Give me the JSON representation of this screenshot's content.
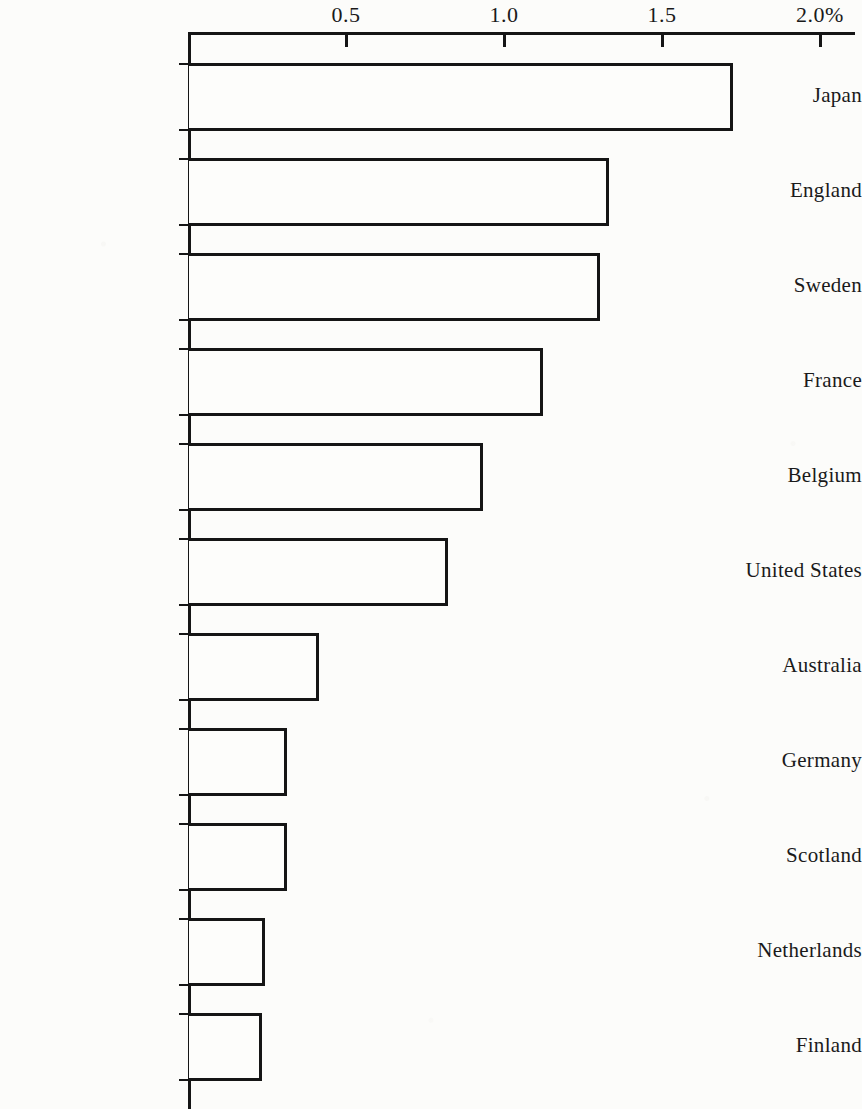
{
  "chart_data": {
    "type": "bar",
    "orientation": "horizontal",
    "title": "",
    "subtitle": "",
    "xlabel": "",
    "ylabel": "",
    "xlim": [
      0,
      2.0
    ],
    "grid": false,
    "legend": null,
    "unit": "%",
    "axis_ticks": [
      {
        "value": 0.5,
        "label": "0.5"
      },
      {
        "value": 1.0,
        "label": "1.0"
      },
      {
        "value": 1.5,
        "label": "1.5"
      },
      {
        "value": 2.0,
        "label": "2.0%"
      }
    ],
    "categories": [
      "Japan",
      "England",
      "Sweden",
      "France",
      "Belgium",
      "United States",
      "Australia",
      "Germany",
      "Scotland",
      "Netherlands",
      "Finland"
    ],
    "values": [
      1.72,
      1.33,
      1.3,
      1.12,
      0.93,
      0.82,
      0.41,
      0.31,
      0.31,
      0.24,
      0.23
    ],
    "bars": [
      {
        "category": "Japan",
        "value": 1.72
      },
      {
        "category": "England",
        "value": 1.33
      },
      {
        "category": "Sweden",
        "value": 1.3
      },
      {
        "category": "France",
        "value": 1.12
      },
      {
        "category": "Belgium",
        "value": 0.93
      },
      {
        "category": "United States",
        "value": 0.82
      },
      {
        "category": "Australia",
        "value": 0.41
      },
      {
        "category": "Germany",
        "value": 0.31
      },
      {
        "category": "Scotland",
        "value": 0.31
      },
      {
        "category": "Netherlands",
        "value": 0.24
      },
      {
        "category": "Finland",
        "value": 0.23
      }
    ],
    "colors": {
      "bar_fill": "#fdfdfb",
      "bar_stroke": "#151515",
      "axis": "#151515",
      "text": "#1a1a1a",
      "background": "#fcfcfa"
    }
  }
}
